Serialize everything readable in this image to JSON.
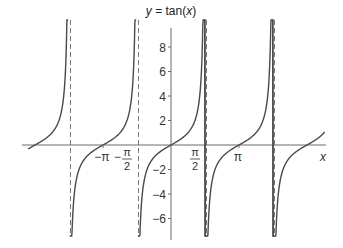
{
  "chart_data": {
    "type": "line",
    "title": "y = tan(x)",
    "title_parts": {
      "y": "y",
      "eq": " = tan(",
      "x": "x",
      "close": ")"
    },
    "xlabel": "x",
    "ylabel": "y",
    "function": "tan(x)",
    "xlim": [
      -6.8,
      7.1
    ],
    "ylim": [
      -7.5,
      10
    ],
    "grid": false,
    "legend": "none",
    "x_ticks": [
      {
        "value": -3.14159,
        "label": "−π"
      },
      {
        "value": -1.5708,
        "label": "−π/2",
        "num": "π",
        "den": "2",
        "neg": true
      },
      {
        "value": 1.5708,
        "label": "π/2",
        "num": "π",
        "den": "2",
        "neg": false
      },
      {
        "value": 3.14159,
        "label": "π"
      }
    ],
    "y_ticks": [
      {
        "value": 8,
        "label": "8"
      },
      {
        "value": 6,
        "label": "6"
      },
      {
        "value": 4,
        "label": "4"
      },
      {
        "value": 2,
        "label": "2"
      },
      {
        "value": -2,
        "label": "−2"
      },
      {
        "value": -4,
        "label": "−4"
      },
      {
        "value": -6,
        "label": "−6"
      }
    ],
    "asymptotes": [
      -4.7124,
      -1.5708,
      1.5708,
      4.7124
    ],
    "series": [
      {
        "name": "tan(x)",
        "domain": [
          -6.6,
          -4.75
        ]
      },
      {
        "name": "tan(x)",
        "domain": [
          -4.68,
          -1.61
        ]
      },
      {
        "name": "tan(x)",
        "domain": [
          -1.53,
          1.61
        ]
      },
      {
        "name": "tan(x)",
        "domain": [
          1.53,
          4.75
        ]
      },
      {
        "name": "tan(x)",
        "domain": [
          4.68,
          7.1
        ]
      }
    ],
    "sample_points": {
      "x": [
        -3.14159,
        -0.7854,
        0,
        0.7854,
        1.3258,
        3.14159,
        6.28318
      ],
      "y": [
        0,
        -1,
        0,
        1,
        4,
        0,
        0
      ]
    }
  },
  "colors": {
    "curve": "#4a4a4a",
    "axis": "#6a6a6a",
    "asymptote": "#777777",
    "text": "#333333"
  }
}
